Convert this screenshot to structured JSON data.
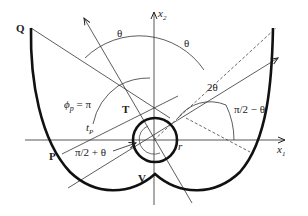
{
  "diagram": {
    "type": "involute-geometry",
    "labels": {
      "Q": "Q",
      "P": "P",
      "T": "T",
      "V": "V",
      "theta_top_left": "θ",
      "theta_top_right": "θ",
      "phi_p": "ϕ",
      "phi_p_sub": "p",
      "phi_p_eq": " = π",
      "two_theta": "2θ",
      "pi2_minus_theta": "π/2 − θ",
      "pi2_plus_theta": "π/2 + θ",
      "t_p": "t",
      "t_p_sub": "P",
      "r": "r",
      "x1": "x",
      "x1_sub": "1",
      "x2": "x",
      "x2_sub": "2"
    },
    "colors": {
      "stroke": "#222222",
      "curve": "#111111",
      "background": "#ffffff"
    }
  }
}
